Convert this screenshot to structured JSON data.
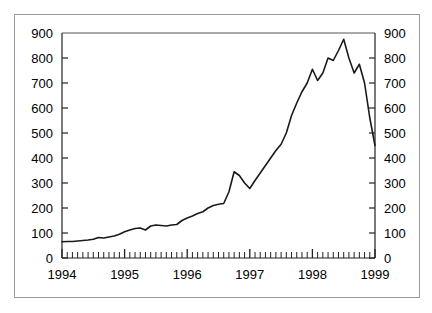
{
  "chart_data": {
    "type": "line",
    "title": "",
    "subtitle": "",
    "xlabel": "",
    "ylabel": "",
    "xlim": [
      1994.0,
      1999.0
    ],
    "ylim": [
      0,
      900
    ],
    "y_ticks": [
      0,
      100,
      200,
      300,
      400,
      500,
      600,
      700,
      800,
      900
    ],
    "y_ticks_right": [
      0,
      100,
      200,
      300,
      400,
      500,
      600,
      700,
      800,
      900
    ],
    "x_ticks_major": [
      "1994",
      "1995",
      "1996",
      "1997",
      "1998",
      "1999"
    ],
    "x_minor_tick_interval": "monthly",
    "grid": false,
    "legend": null,
    "line_color": "#1a1a1a",
    "frame_color": "#9a9a9a",
    "background": "#ffffff",
    "axis_mirrored": true,
    "series": [
      {
        "name": "index",
        "x": [
          1994.0,
          1994.083,
          1994.167,
          1994.25,
          1994.333,
          1994.417,
          1994.5,
          1994.583,
          1994.667,
          1994.75,
          1994.833,
          1994.917,
          1995.0,
          1995.083,
          1995.167,
          1995.25,
          1995.333,
          1995.417,
          1995.5,
          1995.583,
          1995.667,
          1995.75,
          1995.833,
          1995.917,
          1996.0,
          1996.083,
          1996.167,
          1996.25,
          1996.333,
          1996.417,
          1996.5,
          1996.583,
          1996.667,
          1996.75,
          1996.833,
          1996.917,
          1997.0,
          1997.083,
          1997.167,
          1997.25,
          1997.333,
          1997.417,
          1997.5,
          1997.583,
          1997.667,
          1997.75,
          1997.833,
          1997.917,
          1998.0,
          1998.083,
          1998.167,
          1998.25,
          1998.333,
          1998.417,
          1998.5,
          1998.583,
          1998.667,
          1998.75,
          1998.833,
          1998.917,
          1999.0
        ],
        "values": [
          65,
          66,
          66,
          68,
          70,
          72,
          75,
          82,
          80,
          84,
          88,
          95,
          105,
          112,
          118,
          120,
          112,
          128,
          132,
          130,
          128,
          132,
          134,
          150,
          160,
          168,
          178,
          185,
          200,
          210,
          215,
          218,
          265,
          345,
          330,
          300,
          278,
          310,
          340,
          370,
          400,
          430,
          455,
          500,
          570,
          620,
          665,
          700,
          755,
          710,
          740,
          800,
          790,
          830,
          875,
          800,
          740,
          775,
          700,
          560,
          450
        ]
      }
    ],
    "annotations": []
  },
  "axes": {
    "left": {
      "name": "left-y-axis",
      "labels": [
        "900",
        "800",
        "700",
        "600",
        "500",
        "400",
        "300",
        "200",
        "100",
        "0"
      ]
    },
    "right": {
      "name": "right-y-axis",
      "labels": [
        "900",
        "800",
        "700",
        "600",
        "500",
        "400",
        "300",
        "200",
        "100",
        "0"
      ]
    },
    "bottom": {
      "name": "x-axis",
      "labels": [
        "1994",
        "1995",
        "1996",
        "1997",
        "1998",
        "1999"
      ]
    }
  }
}
